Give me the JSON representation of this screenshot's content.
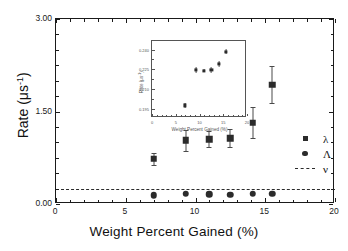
{
  "chart_data": {
    "type": "scatter",
    "title": "",
    "xlabel": "Weight Percent Gained (%)",
    "ylabel": "Rate (μs⁻¹)",
    "xlim": [
      0,
      20
    ],
    "ylim": [
      0,
      3.0
    ],
    "xticks": [
      0,
      5,
      10,
      15,
      20
    ],
    "xticklabels": [
      "0",
      "5",
      "10",
      "15",
      "20"
    ],
    "yticks": [
      0.0,
      1.5,
      3.0
    ],
    "yticklabels": [
      "0.00",
      "1.50",
      "3.00"
    ],
    "grid": false,
    "legend_position": "right",
    "series": [
      {
        "name": "λ",
        "marker": "square",
        "x": [
          7.0,
          9.3,
          11.0,
          12.5,
          14.1,
          15.5
        ],
        "y": [
          0.73,
          1.03,
          1.05,
          1.07,
          1.32,
          1.93
        ],
        "yerr": [
          0.09,
          0.17,
          0.13,
          0.15,
          0.25,
          0.3
        ]
      },
      {
        "name": "Λ",
        "marker": "circle",
        "x": [
          7.0,
          9.3,
          11.0,
          12.5,
          14.1,
          15.5
        ],
        "y": [
          0.14,
          0.17,
          0.16,
          0.15,
          0.17,
          0.17
        ],
        "yerr": [
          0.0,
          0.0,
          0.0,
          0.0,
          0.0,
          0.0
        ]
      },
      {
        "name": "ν",
        "marker": "dashed-line",
        "type": "hline",
        "value": 0.245
      }
    ],
    "legend": [
      {
        "label": "λ",
        "symbol": "square"
      },
      {
        "label": "Λ",
        "symbol": "circle"
      },
      {
        "label": "ν",
        "symbol": "dashed-line"
      }
    ],
    "inset": {
      "type": "scatter",
      "xlabel": "Weight Percent Gained (%)",
      "ylabel": "Rate (μs⁻¹)",
      "xlim": [
        0,
        20
      ],
      "ylim": [
        0.188,
        0.2465
      ],
      "xticks": [
        0,
        5,
        10,
        15,
        20
      ],
      "xticklabels": [
        "0",
        "5",
        "10",
        "15",
        "20"
      ],
      "yticks": [
        0.195,
        0.21,
        0.225,
        0.24
      ],
      "yticklabels": [
        "0.195",
        "0.210",
        "0.225",
        "0.240"
      ],
      "x": [
        7.0,
        9.3,
        11.0,
        12.5,
        14.1,
        15.5
      ],
      "y": [
        0.1975,
        0.2245,
        0.224,
        0.2245,
        0.229,
        0.2385
      ],
      "yerr": [
        0.0022,
        0.0024,
        0.0014,
        0.002,
        0.0024,
        0.0022
      ]
    }
  },
  "axis_titles": {
    "x_main": "Weight Percent Gained (%)",
    "y_main_text": "Rate (μs",
    "y_main_sup": "-1",
    "y_main_close": ")"
  }
}
